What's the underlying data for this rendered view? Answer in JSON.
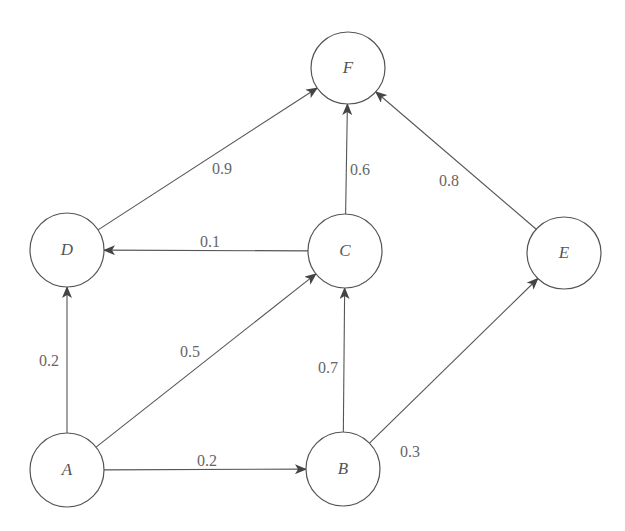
{
  "diagram": {
    "type": "directed-weighted-graph",
    "colors": {
      "stroke": "#555555",
      "label": "#666666",
      "background": "#ffffff"
    },
    "nodes": [
      {
        "id": "F",
        "label": "F",
        "cx": 348,
        "cy": 68,
        "rx": 37,
        "ry": 36
      },
      {
        "id": "D",
        "label": "D",
        "cx": 67,
        "cy": 250,
        "rx": 37,
        "ry": 37
      },
      {
        "id": "C",
        "label": "C",
        "cx": 345,
        "cy": 251,
        "rx": 37,
        "ry": 37
      },
      {
        "id": "E",
        "label": "E",
        "cx": 564,
        "cy": 253,
        "rx": 37,
        "ry": 36
      },
      {
        "id": "A",
        "label": "A",
        "cx": 67,
        "cy": 470,
        "rx": 37,
        "ry": 37
      },
      {
        "id": "B",
        "label": "B",
        "cx": 343,
        "cy": 469,
        "rx": 37,
        "ry": 37
      }
    ],
    "edges": [
      {
        "from": "D",
        "to": "F",
        "weight": "0.9",
        "lx": 222,
        "ly": 170
      },
      {
        "from": "C",
        "to": "F",
        "weight": "0.6",
        "lx": 360,
        "ly": 171
      },
      {
        "from": "E",
        "to": "F",
        "weight": "0.8",
        "lx": 449,
        "ly": 182
      },
      {
        "from": "C",
        "to": "D",
        "weight": "0.1",
        "lx": 210,
        "ly": 243
      },
      {
        "from": "A",
        "to": "D",
        "weight": "0.2",
        "lx": 49,
        "ly": 362
      },
      {
        "from": "A",
        "to": "C",
        "weight": "0.5",
        "lx": 190,
        "ly": 353
      },
      {
        "from": "B",
        "to": "C",
        "weight": "0.7",
        "lx": 328,
        "ly": 369
      },
      {
        "from": "A",
        "to": "B",
        "weight": "0.2",
        "lx": 207,
        "ly": 462
      },
      {
        "from": "B",
        "to": "E",
        "weight": "0.3",
        "lx": 410,
        "ly": 453
      }
    ]
  }
}
